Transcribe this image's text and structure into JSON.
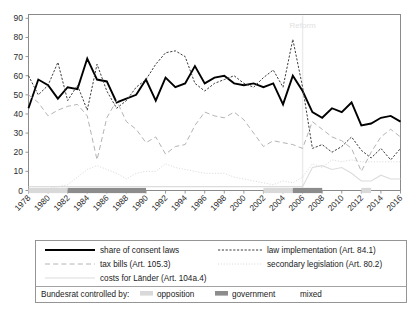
{
  "figure": {
    "background_color": "#ffffff",
    "plot_frame_color": "#8a8a8a"
  },
  "annotations": [
    {
      "name": "reform-marker-label",
      "text": "Reform",
      "x_year": 2006,
      "y_value": 85,
      "color": "#ededed"
    }
  ],
  "legend": {
    "entries": [
      {
        "key": "consent",
        "label": "share of consent laws",
        "style": "solid",
        "color": "#000000",
        "width": 1.9
      },
      {
        "key": "law_impl",
        "label": "law implementation (Art. 84.1)",
        "style": "dashed-fine",
        "color": "#3c3c3c",
        "width": 1.0
      },
      {
        "key": "tax",
        "label": "tax bills (Art. 105.3)",
        "style": "long-dash",
        "color": "#b4b4b4",
        "width": 1.0
      },
      {
        "key": "secondary",
        "label": "secondary legislation (Art. 80.2)",
        "style": "dotted",
        "color": "#d6d6d6",
        "width": 0.9
      },
      {
        "key": "costs",
        "label": "costs for Länder (Art. 104a.4)",
        "style": "solid-light",
        "color": "#dcdcdc",
        "width": 1.1
      }
    ],
    "control_legend": {
      "title": "Bundesrat controlled by:",
      "items": [
        {
          "label": "opposition",
          "color": "#d9d9d9"
        },
        {
          "label": "government",
          "color": "#8c8c8c"
        },
        {
          "label": "mixed",
          "color": "#ffffff"
        }
      ]
    }
  },
  "chart_data": {
    "type": "line",
    "title": "",
    "subtitle": "",
    "xlabel": "",
    "ylabel": "",
    "xlim": [
      1978,
      2016
    ],
    "ylim": [
      0,
      92
    ],
    "grid": false,
    "legend_position": "below-plot",
    "x_ticks": [
      1978,
      1980,
      1982,
      1984,
      1986,
      1988,
      1990,
      1992,
      1994,
      1996,
      1998,
      2000,
      2002,
      2004,
      2006,
      2008,
      2010,
      2012,
      2014,
      2016
    ],
    "y_ticks": [
      0,
      10,
      20,
      30,
      40,
      50,
      60,
      70,
      80,
      90
    ],
    "x": [
      1978,
      1979,
      1980,
      1981,
      1982,
      1983,
      1984,
      1985,
      1986,
      1987,
      1988,
      1989,
      1990,
      1991,
      1992,
      1993,
      1994,
      1995,
      1996,
      1997,
      1998,
      1999,
      2000,
      2001,
      2002,
      2003,
      2004,
      2005,
      2006,
      2007,
      2008,
      2009,
      2010,
      2011,
      2012,
      2013,
      2014,
      2015,
      2016
    ],
    "series": [
      {
        "name": "share of consent laws",
        "key": "consent",
        "style": "solid",
        "color": "#000000",
        "width": 1.9,
        "values": [
          43,
          58,
          55,
          48,
          54,
          53,
          69,
          58,
          57,
          46,
          48,
          50,
          58,
          47,
          59,
          54,
          56,
          65,
          56,
          59,
          60,
          56,
          55,
          56,
          54,
          56,
          45,
          60,
          52,
          41,
          38,
          43,
          41,
          46,
          34,
          35,
          38,
          39,
          36
        ]
      },
      {
        "name": "law implementation (Art. 84.1)",
        "key": "law_impl",
        "style": "dashed-fine",
        "color": "#3c3c3c",
        "width": 1.0,
        "values": [
          60,
          50,
          55,
          67,
          47,
          55,
          42,
          66,
          52,
          43,
          47,
          54,
          58,
          66,
          72,
          73,
          70,
          56,
          52,
          56,
          58,
          60,
          56,
          54,
          59,
          63,
          54,
          79,
          54,
          22,
          24,
          20,
          23,
          28,
          21,
          17,
          22,
          16,
          22
        ]
      },
      {
        "name": "tax bills (Art. 105.3)",
        "key": "tax",
        "style": "long-dash",
        "color": "#b4b4b4",
        "width": 1.0,
        "values": [
          50,
          46,
          39,
          42,
          44,
          45,
          39,
          16,
          38,
          47,
          36,
          32,
          25,
          28,
          19,
          23,
          24,
          34,
          41,
          39,
          38,
          41,
          37,
          30,
          23,
          26,
          25,
          24,
          22,
          36,
          32,
          28,
          26,
          22,
          10,
          20,
          28,
          32,
          28
        ]
      },
      {
        "name": "secondary legislation (Art. 80.2)",
        "key": "secondary",
        "style": "dotted",
        "color": "#d6d6d6",
        "width": 0.9,
        "values": [
          0,
          1,
          1,
          2,
          3,
          7,
          11,
          13,
          11,
          9,
          6,
          9,
          10,
          10,
          14,
          12,
          11,
          10,
          9,
          9,
          9,
          7,
          6,
          5,
          4,
          3,
          5,
          4,
          7,
          14,
          12,
          16,
          15,
          16,
          15,
          15,
          15,
          15,
          15
        ]
      },
      {
        "name": "costs for Länder (Art. 104a.4)",
        "key": "costs",
        "style": "solid-light",
        "color": "#dcdcdc",
        "width": 1.1,
        "values": [
          2,
          2,
          2,
          2,
          2,
          2,
          2,
          2,
          2,
          2,
          2,
          2,
          2,
          2,
          2,
          2,
          2,
          2,
          2,
          2,
          2,
          2,
          2,
          2,
          2,
          2,
          2,
          2,
          2,
          12,
          13,
          11,
          12,
          9,
          5,
          5,
          8,
          6,
          6
        ]
      }
    ],
    "control_bands": [
      {
        "from": 1978,
        "to": 1982,
        "control": "opposition",
        "color": "#d9d9d9"
      },
      {
        "from": 1982,
        "to": 1990,
        "control": "government",
        "color": "#8c8c8c"
      },
      {
        "from": 1990,
        "to": 1991,
        "control": "mixed",
        "color": "#ffffff"
      },
      {
        "from": 2002,
        "to": 2005,
        "control": "opposition",
        "color": "#d9d9d9"
      },
      {
        "from": 2005,
        "to": 2008,
        "control": "government",
        "color": "#8c8c8c"
      },
      {
        "from": 2012,
        "to": 2013,
        "control": "opposition",
        "color": "#d9d9d9"
      }
    ],
    "reform_marker": {
      "x_year": 2006,
      "color": "#ebebeb"
    }
  }
}
